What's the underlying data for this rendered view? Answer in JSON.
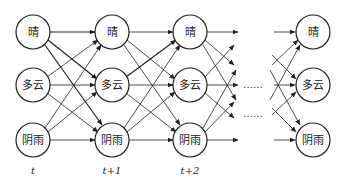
{
  "diagram": {
    "type": "hidden-markov-trellis",
    "states": [
      "晴",
      "多云",
      "阴雨"
    ],
    "time_steps": [
      {
        "label": "t",
        "x": 33
      },
      {
        "label": "t+1",
        "x": 112
      },
      {
        "label": "t+2",
        "x": 190
      },
      {
        "label": "",
        "x": 313
      }
    ],
    "row_y": [
      32,
      85,
      140
    ],
    "node_radius": 17,
    "ellipsis": "……",
    "colors": {
      "stroke": "#222222",
      "background": "#ffffff"
    }
  },
  "nodes": {
    "t0": [
      "晴",
      "多云",
      "阴雨"
    ],
    "t1": [
      "晴",
      "多云",
      "阴雨"
    ],
    "t2": [
      "晴",
      "多云",
      "阴雨"
    ],
    "tn": [
      "晴",
      "多云",
      "阴雨"
    ]
  },
  "time_labels": {
    "t0": "t",
    "t1": "t+1",
    "t2": "t+2"
  },
  "ellipsis": {
    "upper": "……",
    "lower": "……"
  }
}
